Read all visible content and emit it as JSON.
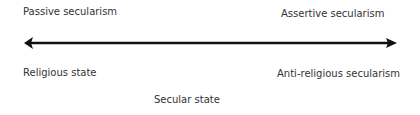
{
  "diagram": {
    "type": "spectrum",
    "top_labels": {
      "left": "Passive secularism",
      "right": "Assertive secularism"
    },
    "bottom_labels": {
      "left": "Religious state",
      "center": "Secular state",
      "right": "Anti-religious secularism"
    },
    "axis": {
      "style": "double-headed-arrow",
      "color": "#111111"
    }
  }
}
